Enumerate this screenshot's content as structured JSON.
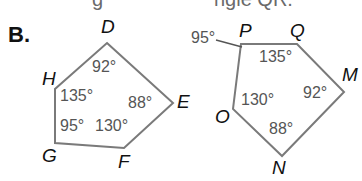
{
  "header_fragment": {
    "left": "g",
    "right": "ngle QR."
  },
  "section_label": "B.",
  "stroke_color": "#7a7a7a",
  "pentagon_left": {
    "vertices": [
      {
        "name": "D",
        "x": 107,
        "y": 43
      },
      {
        "name": "E",
        "x": 173,
        "y": 103
      },
      {
        "name": "F",
        "x": 124,
        "y": 148
      },
      {
        "name": "G",
        "x": 55,
        "y": 143
      },
      {
        "name": "H",
        "x": 55,
        "y": 89
      }
    ],
    "labels": {
      "D": "D",
      "E": "E",
      "F": "F",
      "G": "G",
      "H": "H"
    },
    "angles": {
      "D": "92°",
      "E": "88°",
      "F": "130°",
      "G": "95°",
      "H": "135°"
    }
  },
  "pentagon_right": {
    "vertices": [
      {
        "name": "P",
        "x": 241,
        "y": 44
      },
      {
        "name": "Q",
        "x": 297,
        "y": 44
      },
      {
        "name": "M",
        "x": 344,
        "y": 92
      },
      {
        "name": "N",
        "x": 282,
        "y": 156
      },
      {
        "name": "O",
        "x": 233,
        "y": 109
      }
    ],
    "labels": {
      "P": "P",
      "Q": "Q",
      "M": "M",
      "N": "N",
      "O": "O"
    },
    "angles": {
      "P": "95°",
      "Q": "135°",
      "M": "92°",
      "N": "88°",
      "O": "130°"
    }
  }
}
